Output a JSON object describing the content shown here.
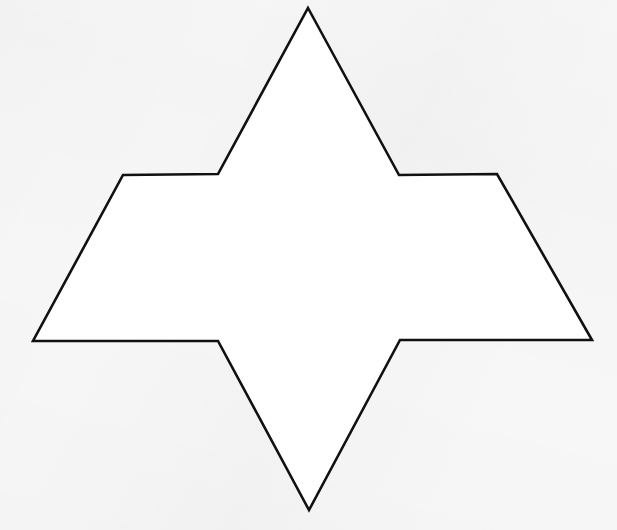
{
  "canvas": {
    "width": 617,
    "height": 530,
    "background_color": "#f7f7f7",
    "paper_tint": "#f2f2f2"
  },
  "figure": {
    "name": "six-pointed-star-outline",
    "title": "Six-Pointed Star Outline",
    "stroke_color": "#111111",
    "fill_color": "#ffffff",
    "stroke_width": 2.6,
    "stroke_linejoin": "miter",
    "closed": true,
    "vertex_count": 12,
    "points": "308,8 399,175 497,174 592,340 400,340 309,510 218,341 33,341 123,175 218,174",
    "vertices": [
      {
        "label": "top-apex",
        "x": 308,
        "y": 8
      },
      {
        "label": "upper-right-inner",
        "x": 399,
        "y": 175
      },
      {
        "label": "upper-right-outer",
        "x": 497,
        "y": 174
      },
      {
        "label": "right-tip",
        "x": 592,
        "y": 340
      },
      {
        "label": "lower-right-inner",
        "x": 400,
        "y": 340
      },
      {
        "label": "bottom-apex",
        "x": 309,
        "y": 510
      },
      {
        "label": "lower-left-inner",
        "x": 218,
        "y": 341
      },
      {
        "label": "left-tip",
        "x": 33,
        "y": 341
      },
      {
        "label": "upper-left-outer",
        "x": 123,
        "y": 175
      },
      {
        "label": "upper-left-inner",
        "x": 218,
        "y": 174
      }
    ],
    "bounding_box": {
      "x": 33,
      "y": 8,
      "width": 559,
      "height": 502
    }
  }
}
